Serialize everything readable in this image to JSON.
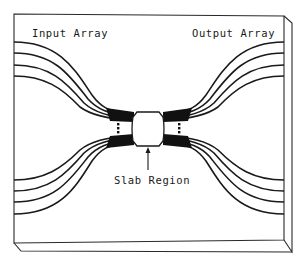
{
  "diagram": {
    "labels": {
      "input": "Input Array",
      "output": "Output Array",
      "slab": "Slab Region"
    },
    "components": {
      "input_waveguides_upper": 4,
      "input_waveguides_lower": 4,
      "output_waveguides_upper": 4,
      "output_waveguides_lower": 4,
      "slab": "free-propagation slab region (center)",
      "ellipsis_markers": 2
    },
    "colors": {
      "line": "#1a1a1a",
      "background": "#ffffff"
    }
  }
}
